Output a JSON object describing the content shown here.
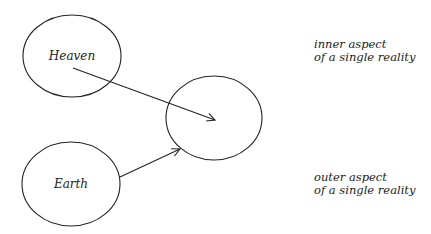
{
  "diagram": {
    "nodes": [
      {
        "id": "heaven",
        "label": "Heaven"
      },
      {
        "id": "unity",
        "label": ""
      },
      {
        "id": "earth",
        "label": "Earth"
      }
    ],
    "edges": [
      {
        "from": "heaven",
        "to": "unity"
      },
      {
        "from": "earth",
        "to": "unity"
      }
    ],
    "annotations": {
      "inner": {
        "line1": "inner aspect",
        "line2": "of a single reality"
      },
      "outer": {
        "line1": "outer aspect",
        "line2": "of a single reality"
      }
    },
    "colors": {
      "stroke": "#222222",
      "background": "#ffffff"
    }
  }
}
